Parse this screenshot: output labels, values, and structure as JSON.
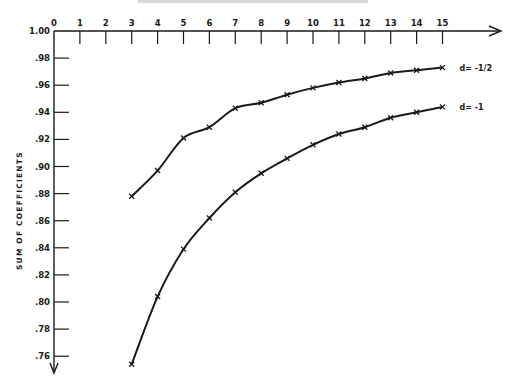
{
  "chart_data": {
    "type": "line",
    "title": "",
    "xlabel": "",
    "ylabel": "SUM OF COEFFICIENTS",
    "x_ticks": [
      0,
      1,
      2,
      3,
      4,
      5,
      6,
      7,
      8,
      9,
      10,
      11,
      12,
      13,
      14,
      15
    ],
    "y_ticks": [
      "1.00",
      ".98",
      ".96",
      ".94",
      ".92",
      ".90",
      ".88",
      ".86",
      ".84",
      ".82",
      ".80",
      ".78",
      ".76"
    ],
    "xlim": [
      0,
      15
    ],
    "ylim": [
      0.76,
      1.0
    ],
    "grid": false,
    "legend_position": "inline-right",
    "x": [
      3,
      4,
      5,
      6,
      7,
      8,
      9,
      10,
      11,
      12,
      13,
      14,
      15
    ],
    "series": [
      {
        "name": "d= -1/2",
        "values": [
          0.878,
          0.897,
          0.921,
          0.929,
          0.943,
          0.947,
          0.953,
          0.958,
          0.962,
          0.965,
          0.969,
          0.971,
          0.973
        ]
      },
      {
        "name": "d= -1",
        "values": [
          0.754,
          0.804,
          0.839,
          0.862,
          0.881,
          0.895,
          0.906,
          0.916,
          0.924,
          0.929,
          0.936,
          0.94,
          0.944
        ]
      }
    ]
  },
  "colors": {
    "ink": "#1a1a1a",
    "background": "#ffffff"
  }
}
